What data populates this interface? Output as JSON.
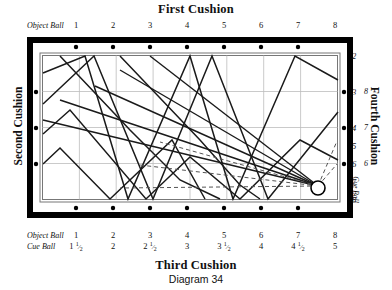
{
  "titles": {
    "first_cushion": "First Cushion",
    "second_cushion": "Second Cushion",
    "third_cushion": "Third Cushion",
    "fourth_cushion": "Fourth Cushion",
    "caption": "Diagram 34"
  },
  "labels": {
    "object_ball": "Object Ball",
    "cue_ball": "Cue Ball",
    "cue_ball_side": "Cue Ball"
  },
  "top_scale": {
    "label": "Object Ball",
    "values": [
      "1",
      "2",
      "3",
      "4",
      "5",
      "6",
      "7",
      "8"
    ]
  },
  "bottom_scale_object": {
    "label": "Object Ball",
    "values": [
      "1",
      "2",
      "3",
      "4",
      "5",
      "6",
      "7",
      "8"
    ]
  },
  "bottom_scale_cue": {
    "label": "Cue Ball",
    "values": [
      "1 1/2",
      "2",
      "2 1/2",
      "3",
      "3 1/2",
      "4",
      "4 1/2",
      "5"
    ]
  },
  "right_scale_primary": [
    "2",
    "3",
    "4",
    "5",
    "6",
    "7",
    "8"
  ],
  "right_scale_secondary": [
    "8",
    "7",
    "6"
  ],
  "chart_data": {
    "type": "diagram",
    "title": "Diagram 34",
    "table": {
      "outer_rail_color": "#000000",
      "cloth_color": "#ffffff",
      "grid_color": "#b8b8b8",
      "path_color": "#1a1a1a",
      "dashed_color": "#555555"
    },
    "cue_ball": {
      "x": 8,
      "y": 8,
      "radius_px": 7,
      "fill": "#ffffff",
      "stroke": "#000000"
    },
    "top_rail_diamonds": 7,
    "bottom_rail_diamonds": 7,
    "left_rail_diamonds": 3,
    "right_rail_diamonds": 3,
    "grid_vertical_lines": 7,
    "grid_horizontal_lines": 3,
    "dashed_lines": 3,
    "fan_lines_from_cue_ball": 5,
    "zigzag_paths": 6
  }
}
